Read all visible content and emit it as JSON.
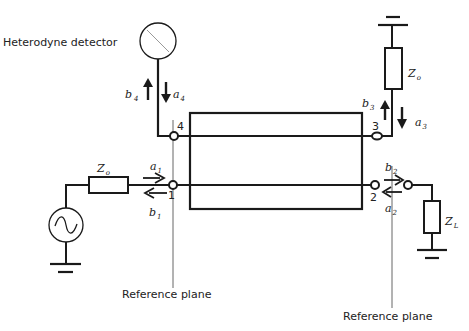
{
  "diagram": {
    "type": "circuit",
    "title": "",
    "labels": {
      "detector": "Heterodyne detector",
      "reference_plane_left": "Reference plane",
      "reference_plane_right": "Reference plane"
    },
    "ports": {
      "p1": "1",
      "p2": "2",
      "p3": "3",
      "p4": "4"
    },
    "waves": {
      "a1": {
        "base": "a",
        "sub": "1"
      },
      "b1": {
        "base": "b",
        "sub": "1"
      },
      "a2": {
        "base": "a",
        "sub": "2"
      },
      "b2": {
        "base": "b",
        "sub": "2"
      },
      "a3": {
        "base": "a",
        "sub": "3"
      },
      "b3": {
        "base": "b",
        "sub": "3"
      },
      "a4": {
        "base": "a",
        "sub": "4"
      },
      "b4": {
        "base": "b",
        "sub": "4"
      }
    },
    "impedances": {
      "source": {
        "base": "Z",
        "sub": "o"
      },
      "port3": {
        "base": "Z",
        "sub": "o"
      },
      "load": {
        "base": "Z",
        "sub": "L"
      }
    },
    "colors": {
      "line": "#1a1a1a",
      "thin": "#555555",
      "text": "#222222"
    }
  }
}
